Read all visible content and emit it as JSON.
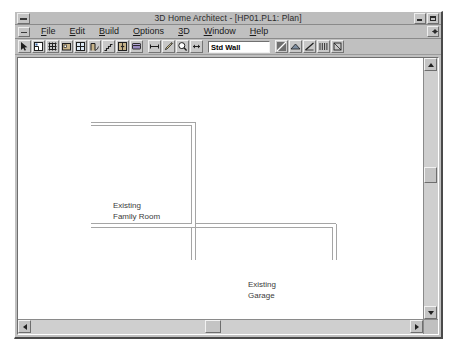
{
  "window": {
    "title": "3D Home Architect - [HP01.PL1: Plan]",
    "minimize_label": "minimize",
    "maximize_label": "maximize",
    "system_menu_label": "system-menu",
    "document_restore_label": "restore-document"
  },
  "menu": {
    "items": [
      {
        "label": "File",
        "accel": "F"
      },
      {
        "label": "Edit",
        "accel": "E"
      },
      {
        "label": "Build",
        "accel": "B"
      },
      {
        "label": "Options",
        "accel": "O"
      },
      {
        "label": "3D",
        "accel": "3"
      },
      {
        "label": "Window",
        "accel": "W"
      },
      {
        "label": "Help",
        "accel": "H"
      }
    ]
  },
  "toolbar": {
    "wall_type_value": "Std Wall",
    "wall_type_placeholder": "Std Wall",
    "buttons": [
      {
        "name": "select-arrow-tool",
        "title": "Select"
      },
      {
        "name": "floor-plan-tool",
        "title": "Plan"
      },
      {
        "name": "grid-tool",
        "title": "Grid"
      },
      {
        "name": "room-tool",
        "title": "Room"
      },
      {
        "name": "window-tool",
        "title": "Window"
      },
      {
        "name": "door-tool",
        "title": "Door"
      },
      {
        "name": "stairs-tool",
        "title": "Stairs"
      },
      {
        "name": "cabinet-tool",
        "title": "Cabinet"
      },
      {
        "name": "furniture-tool",
        "title": "Furniture"
      },
      {
        "name": "dimension-tool",
        "title": "Dimension"
      },
      {
        "name": "pencil-tool",
        "title": "Draw"
      },
      {
        "name": "zoom-tool",
        "title": "Zoom"
      },
      {
        "name": "pan-tool",
        "title": "Pan"
      },
      {
        "name": "wall-swatch-tool",
        "title": "Wall Material"
      },
      {
        "name": "roof-tool",
        "title": "Roof"
      },
      {
        "name": "slope-tool",
        "title": "Slope"
      },
      {
        "name": "deck-tool",
        "title": "Deck"
      },
      {
        "name": "misc-tool",
        "title": "Misc"
      }
    ]
  },
  "plan": {
    "labels": [
      {
        "name": "family-room-label",
        "line1": "Existing",
        "line2": "Family Room",
        "x": 111,
        "y": 158
      },
      {
        "name": "garage-label",
        "line1": "Existing",
        "line2": "Garage",
        "x": 246,
        "y": 237
      }
    ],
    "walls": [
      {
        "name": "family-room-top-wall",
        "x1": 88,
        "y1": 125,
        "x2": 190,
        "y2": 125,
        "orientation": "horizontal"
      },
      {
        "name": "family-room-right-wall",
        "x1": 190,
        "y1": 125,
        "x2": 190,
        "y2": 227,
        "orientation": "vertical"
      },
      {
        "name": "family-room-bottom-wall",
        "x1": 88,
        "y1": 227,
        "x2": 190,
        "y2": 227,
        "orientation": "horizontal"
      },
      {
        "name": "garage-top-wall",
        "x1": 190,
        "y1": 227,
        "x2": 330,
        "y2": 227,
        "orientation": "horizontal"
      },
      {
        "name": "garage-left-wall",
        "x1": 190,
        "y1": 227,
        "x2": 190,
        "y2": 262,
        "orientation": "vertical"
      },
      {
        "name": "garage-right-wall",
        "x1": 330,
        "y1": 227,
        "x2": 330,
        "y2": 262,
        "orientation": "vertical"
      }
    ]
  },
  "scrollbars": {
    "vertical": {
      "name": "vertical-scrollbar",
      "thumb_top_pct": 44,
      "thumb_size_px": 16
    },
    "horizontal": {
      "name": "horizontal-scrollbar",
      "thumb_left_pct": 48,
      "thumb_size_px": 16
    }
  },
  "colors": {
    "window_face": "#c0c0c0",
    "title_bar": "#bdbdbd",
    "canvas": "#ffffff",
    "wall_line": "#9a9a9a",
    "label_text": "#3b3b3b"
  }
}
